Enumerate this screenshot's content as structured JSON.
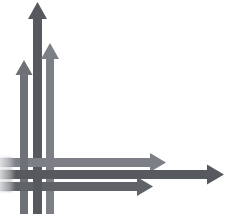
{
  "image": {
    "title": "Crossing Arrows Diagram",
    "width": 229,
    "height": 219,
    "background_color": "#ffffff",
    "description": "Three vertical gray arrows pointing up interlace with three horizontal gray arrows pointing right, forming a woven grid at the lower-left corner."
  },
  "palette": {
    "dark_gray": "#565a5e",
    "medium_gray": "#6e7277",
    "light_gray": "#80848a",
    "paper_white": "#ffffff",
    "shadow_tint": "#c9ccd0"
  },
  "arrows": {
    "vertical": [
      {
        "id": "vertical-arrow-left",
        "label": "Left upward arrow",
        "direction": "up",
        "color": "#6e7277",
        "shaft_x": 20,
        "shaft_width": 8,
        "tip_y": 60,
        "base_y": 214,
        "head_width": 17,
        "head_height": 15
      },
      {
        "id": "vertical-arrow-center",
        "label": "Center tall upward arrow",
        "direction": "up",
        "color": "#565a5e",
        "shaft_x": 33,
        "shaft_width": 9,
        "tip_y": 2,
        "base_y": 214,
        "head_width": 19,
        "head_height": 17
      },
      {
        "id": "vertical-arrow-right",
        "label": "Right upward arrow",
        "direction": "up",
        "color": "#7c8086",
        "shaft_x": 46,
        "shaft_width": 8,
        "tip_y": 43,
        "base_y": 214,
        "head_width": 18,
        "head_height": 16
      }
    ],
    "horizontal": [
      {
        "id": "horizontal-arrow-top",
        "label": "Upper rightward arrow",
        "direction": "right",
        "color": "#7c8086",
        "shaft_y": 158,
        "shaft_height": 9,
        "start_x": 0,
        "tip_x": 166,
        "head_width": 16,
        "head_height": 19
      },
      {
        "id": "horizontal-arrow-middle",
        "label": "Middle long rightward arrow",
        "direction": "right",
        "color": "#565a5e",
        "shaft_y": 170,
        "shaft_height": 9,
        "start_x": 0,
        "tip_x": 224,
        "head_width": 17,
        "head_height": 20
      },
      {
        "id": "horizontal-arrow-bottom",
        "label": "Lower rightward arrow",
        "direction": "right",
        "color": "#5e6266",
        "shaft_y": 182,
        "shaft_height": 9,
        "start_x": 0,
        "tip_x": 153,
        "head_width": 16,
        "head_height": 19
      }
    ]
  },
  "intersection": {
    "label": "Weave crossing region",
    "x": 12,
    "y": 152,
    "width": 48,
    "height": 44
  },
  "captions": []
}
